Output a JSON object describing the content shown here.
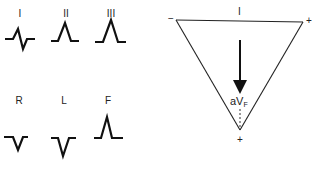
{
  "leads_panel": {
    "top_row": [
      {
        "label": "I",
        "waveform": "biphasic-small"
      },
      {
        "label": "II",
        "waveform": "upright"
      },
      {
        "label": "III",
        "waveform": "upright-tall"
      }
    ],
    "bottom_row": [
      {
        "label": "R",
        "waveform": "inverted"
      },
      {
        "label": "L",
        "waveform": "inverted-deep"
      },
      {
        "label": "F",
        "waveform": "upright-tall"
      }
    ]
  },
  "triangle": {
    "top_label": "I",
    "left_pole": "−",
    "right_pole": "+",
    "bottom_pole": "+",
    "axis_label_main": "aV",
    "axis_label_sub": "F"
  },
  "colors": {
    "line": "#111111",
    "background": "#ffffff"
  }
}
